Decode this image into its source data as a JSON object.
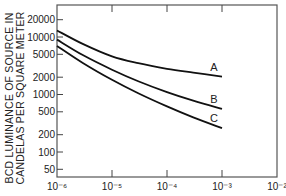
{
  "chart_data": {
    "type": "line",
    "title": "",
    "xlabel": "",
    "ylabel": "BCD LUMINANCE OF SOURCE IN CANDELAS PER SQUARE METER",
    "ylabel_lines": [
      "BCD LUMINANCE OF SOURCE IN",
      "CANDELAS PER SQUARE METER"
    ],
    "x_scale": "log",
    "y_scale": "log",
    "xlim": [
      1e-06,
      0.01
    ],
    "ylim": [
      35,
      35000
    ],
    "x_ticks": [
      1e-06,
      1e-05,
      0.0001,
      0.001,
      0.01
    ],
    "x_tick_labels": [
      "10⁻⁶",
      "10⁻⁵",
      "10⁻⁴",
      "10⁻³",
      "10⁻²"
    ],
    "y_ticks": [
      20000,
      10000,
      5000,
      2000,
      1000,
      500,
      200,
      100,
      50
    ],
    "y_tick_labels": [
      "20000",
      "10000",
      "5000",
      "2000",
      "1000",
      "500",
      "200",
      "100",
      "50"
    ],
    "grid": false,
    "legend": "inline labels at curve ends",
    "x": [
      1e-06,
      3e-06,
      1e-05,
      3e-05,
      0.0001,
      0.0003,
      0.001
    ],
    "series": [
      {
        "name": "A",
        "values": [
          13000,
          7500,
          4600,
          3500,
          2800,
          2400,
          2050
        ]
      },
      {
        "name": "B",
        "values": [
          9000,
          4800,
          2700,
          1700,
          1100,
          780,
          560
        ]
      },
      {
        "name": "C",
        "values": [
          7000,
          3500,
          1800,
          1050,
          620,
          400,
          260
        ]
      }
    ]
  }
}
